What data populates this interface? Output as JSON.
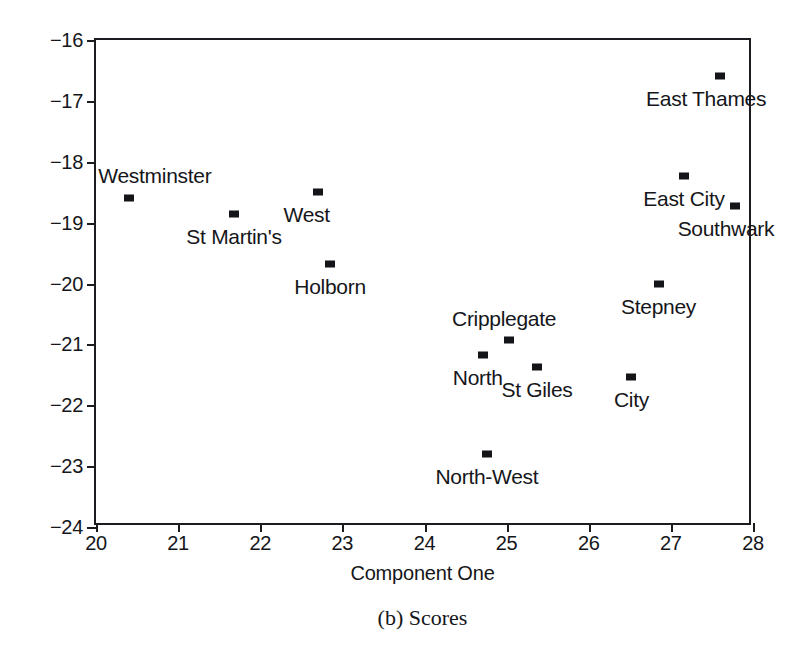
{
  "caption": "(b) Scores",
  "chart_data": {
    "type": "scatter",
    "title": "",
    "subtitle": "",
    "xlabel": "Component One",
    "ylabel": "Component Two",
    "xlim": [
      20,
      28
    ],
    "ylim": [
      -24,
      -16
    ],
    "xticks": [
      "20",
      "21",
      "22",
      "23",
      "24",
      "25",
      "26",
      "27",
      "28"
    ],
    "yticks": [
      "−16",
      "−17",
      "−18",
      "−19",
      "−20",
      "−21",
      "−22",
      "−23",
      "−24"
    ],
    "xtick_values": [
      20,
      21,
      22,
      23,
      24,
      25,
      26,
      27,
      28
    ],
    "ytick_values": [
      -16,
      -17,
      -18,
      -19,
      -20,
      -21,
      -22,
      -23,
      -24
    ],
    "grid": false,
    "legend": "none",
    "marker_color": "#141519",
    "axis_color": "#1b1c20",
    "points": [
      {
        "label": "Westminster",
        "x": 20.4,
        "y": -18.59,
        "label_pos": "above",
        "dx": 26,
        "dy": -12
      },
      {
        "label": "St Martin's",
        "x": 21.68,
        "y": -18.86,
        "label_pos": "below",
        "dx": 0,
        "dy": 10
      },
      {
        "label": "West",
        "x": 22.7,
        "y": -18.5,
        "label_pos": "below",
        "dx": -11,
        "dy": 10
      },
      {
        "label": "Holborn",
        "x": 22.85,
        "y": -19.68,
        "label_pos": "below",
        "dx": 0,
        "dy": 10
      },
      {
        "label": "Cripplegate",
        "x": 25.03,
        "y": -20.93,
        "label_pos": "above",
        "dx": -5,
        "dy": -11
      },
      {
        "label": "North",
        "x": 24.71,
        "y": -21.17,
        "label_pos": "below",
        "dx": -5,
        "dy": 10
      },
      {
        "label": "St Giles",
        "x": 25.37,
        "y": -21.37,
        "label_pos": "below",
        "dx": 0,
        "dy": 10
      },
      {
        "label": "North-West",
        "x": 24.76,
        "y": -22.8,
        "label_pos": "below",
        "dx": 0,
        "dy": 10
      },
      {
        "label": "City",
        "x": 26.52,
        "y": -21.53,
        "label_pos": "below",
        "dx": 0,
        "dy": 10
      },
      {
        "label": "Stepney",
        "x": 26.85,
        "y": -20.01,
        "label_pos": "below",
        "dx": 0,
        "dy": 10
      },
      {
        "label": "East City",
        "x": 27.16,
        "y": -18.23,
        "label_pos": "below",
        "dx": 0,
        "dy": 10
      },
      {
        "label": "Southwark",
        "x": 27.78,
        "y": -18.73,
        "label_pos": "below",
        "dx": -9,
        "dy": 10
      },
      {
        "label": "East Thames",
        "x": 27.6,
        "y": -16.59,
        "label_pos": "below",
        "dx": -14,
        "dy": 10
      }
    ]
  }
}
